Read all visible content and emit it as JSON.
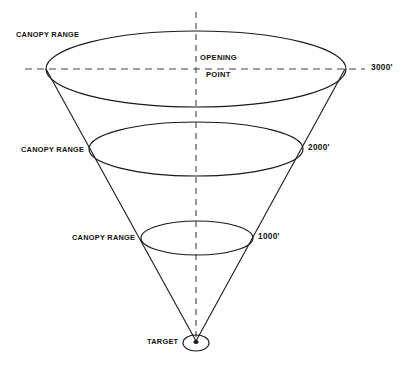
{
  "diagram": {
    "background_color": "#ffffff",
    "line_color": "#1a1a1a",
    "labels": {
      "canopy_range_3000": "CANOPY RANGE",
      "canopy_range_2000": "CANOPY RANGE",
      "canopy_range_1000": "CANOPY RANGE",
      "opening_point_line1": "OPENING",
      "opening_point_line2": "POINT",
      "altitude_3000": "3000'",
      "altitude_2000": "2000'",
      "altitude_1000": "1000'",
      "target": "TARGET"
    }
  }
}
